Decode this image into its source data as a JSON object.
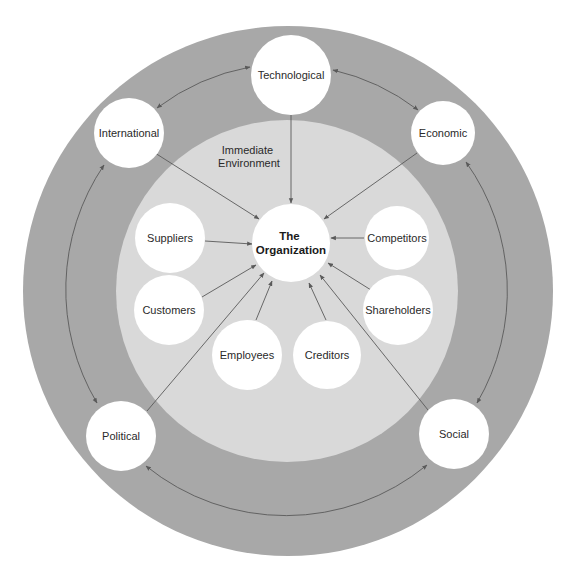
{
  "diagram": {
    "colors": {
      "background": "#ffffff",
      "general_environment_ring": "#a8a8a8",
      "immediate_environment_ring": "#d9d9d9",
      "node_fill": "#ffffff",
      "connector": "#5a5a5a",
      "text": "#2a2a2a"
    },
    "center": {
      "line1": "The",
      "line2": "Organization"
    },
    "immediate_environment": {
      "label_line1": "Immediate",
      "label_line2": "Environment",
      "nodes": [
        {
          "id": "suppliers",
          "label": "Suppliers"
        },
        {
          "id": "customers",
          "label": "Customers"
        },
        {
          "id": "employees",
          "label": "Employees"
        },
        {
          "id": "creditors",
          "label": "Creditors"
        },
        {
          "id": "shareholders",
          "label": "Shareholders"
        },
        {
          "id": "competitors",
          "label": "Competitors"
        }
      ]
    },
    "general_environment": {
      "nodes": [
        {
          "id": "technological",
          "label": "Technological"
        },
        {
          "id": "economic",
          "label": "Economic"
        },
        {
          "id": "social",
          "label": "Social"
        },
        {
          "id": "political",
          "label": "Political"
        },
        {
          "id": "international",
          "label": "International"
        }
      ]
    },
    "relations": {
      "into_organization": [
        "technological",
        "international",
        "economic",
        "political",
        "social",
        "suppliers",
        "customers",
        "employees",
        "creditors",
        "shareholders",
        "competitors"
      ],
      "bidirectional_ring": [
        [
          "international",
          "technological"
        ],
        [
          "technological",
          "economic"
        ],
        [
          "economic",
          "social"
        ],
        [
          "social",
          "political"
        ],
        [
          "political",
          "international"
        ]
      ]
    }
  }
}
